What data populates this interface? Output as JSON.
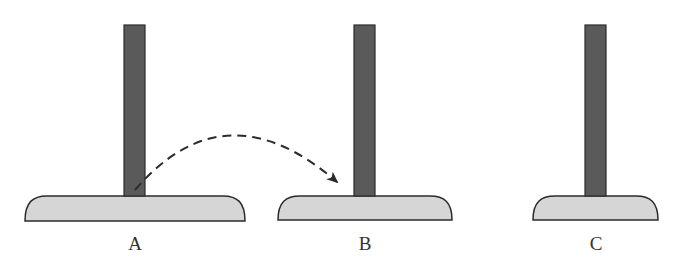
{
  "diagram": {
    "title": "",
    "colors": {
      "peg": "#5a5a5a",
      "peg_stroke": "#2b2b2b",
      "base": "#d6d6d6",
      "base_stroke": "#2b2b2b",
      "arrow": "#2b2b2b",
      "label": "#333333"
    },
    "towers": [
      {
        "id": "A",
        "label": "A",
        "peg": {
          "x": 124,
          "y": 25,
          "w": 21,
          "h": 171
        },
        "base": {
          "x1": 25,
          "x2": 245,
          "top": 196,
          "bottom": 221
        },
        "label_x": 135
      },
      {
        "id": "B",
        "label": "B",
        "peg": {
          "x": 354,
          "y": 25,
          "w": 21,
          "h": 171
        },
        "base": {
          "x1": 278,
          "x2": 452,
          "top": 196,
          "bottom": 220
        },
        "label_x": 365
      },
      {
        "id": "C",
        "label": "C",
        "peg": {
          "x": 585,
          "y": 25,
          "w": 21,
          "h": 171
        },
        "base": {
          "x1": 533,
          "x2": 658,
          "top": 196,
          "bottom": 220
        },
        "label_x": 596
      }
    ],
    "move_arrow": {
      "from": "A",
      "to": "B",
      "style": "dashed-curved",
      "start": [
        135,
        190
      ],
      "control": [
        225,
        85
      ],
      "end": [
        337,
        182
      ]
    }
  }
}
